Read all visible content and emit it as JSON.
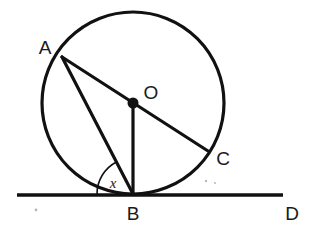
{
  "figure": {
    "type": "circle-geometry-diagram",
    "background_color": "#ffffff",
    "ink_color": "#111111",
    "canvas": {
      "width": 321,
      "height": 234
    }
  },
  "circle": {
    "name": "main-circle",
    "center": {
      "x": 133,
      "y": 103
    },
    "radius": 91,
    "stroke_width": 3.2
  },
  "points": {
    "A": {
      "label": "A",
      "x": 62,
      "y": 57,
      "label_x": 45,
      "label_y": 54
    },
    "O": {
      "label": "O",
      "x": 133,
      "y": 103,
      "label_x": 151,
      "label_y": 99,
      "dot_radius": 5.5
    },
    "B": {
      "label": "B",
      "x": 133,
      "y": 194,
      "label_x": 133,
      "label_y": 220
    },
    "C": {
      "label": "C",
      "x": 208,
      "y": 151,
      "label_x": 223,
      "label_y": 165
    },
    "D": {
      "label": "D",
      "x": 283,
      "y": 195,
      "label_x": 292,
      "label_y": 220
    }
  },
  "segments": [
    {
      "name": "diameter-A-O-C",
      "from": "A",
      "to": "C",
      "through": "O",
      "x1": 62,
      "y1": 57,
      "x2": 208,
      "y2": 151
    },
    {
      "name": "chord-A-B",
      "from": "A",
      "to": "B",
      "x1": 62,
      "y1": 57,
      "x2": 133,
      "y2": 194
    },
    {
      "name": "radius-O-B",
      "from": "O",
      "to": "B",
      "x1": 133,
      "y1": 103,
      "x2": 133,
      "y2": 194
    },
    {
      "name": "tangent-line-B-D",
      "from": "tangent-left-end",
      "to": "D",
      "x1": 17,
      "y1": 195,
      "x2": 283,
      "y2": 195
    }
  ],
  "angle": {
    "name": "angle-x",
    "label": "x",
    "vertex": "B",
    "between": [
      "tangent-toward-left",
      "chord-B-A"
    ],
    "arc_radius": 36,
    "label_x": 113,
    "label_y": 188
  },
  "specks": [
    {
      "x": 36,
      "y": 210,
      "r": 1.4
    },
    {
      "x": 206,
      "y": 181,
      "r": 1.2
    },
    {
      "x": 215,
      "y": 183,
      "r": 1.0
    }
  ]
}
